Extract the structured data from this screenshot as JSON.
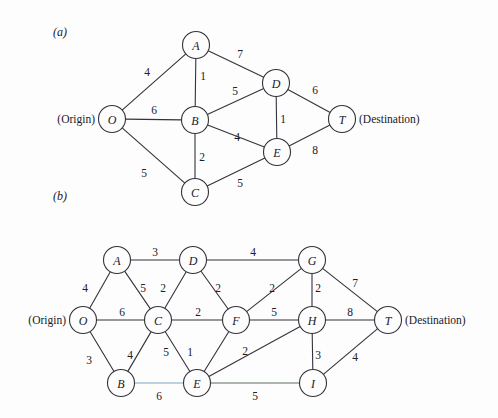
{
  "figure": {
    "background": "#fdfdfd",
    "line_color": "#33333a",
    "width": 498,
    "height": 418
  },
  "panels": [
    {
      "id": "panel-a",
      "label": "(a)",
      "label_pos": {
        "x": 53,
        "y": 32
      },
      "origin_caption": "(Origin)",
      "origin_caption_pos": {
        "x": 95,
        "y": 119
      },
      "destination_caption": "(Destination)",
      "destination_caption_pos": {
        "x": 359,
        "y": 119
      },
      "node_radius": 13.5,
      "nodes": [
        {
          "id": "O",
          "label": "O",
          "x": 112,
          "y": 119
        },
        {
          "id": "A",
          "label": "A",
          "x": 196,
          "y": 45
        },
        {
          "id": "B",
          "label": "B",
          "x": 195,
          "y": 120
        },
        {
          "id": "C",
          "label": "C",
          "x": 195,
          "y": 192
        },
        {
          "id": "D",
          "label": "D",
          "x": 276,
          "y": 83
        },
        {
          "id": "E",
          "label": "E",
          "x": 277,
          "y": 152
        },
        {
          "id": "T",
          "label": "T",
          "x": 342,
          "y": 119
        }
      ],
      "edges": [
        {
          "from": "O",
          "to": "A",
          "weight": "4",
          "label_x": 147,
          "label_y": 72,
          "tint": "none"
        },
        {
          "from": "O",
          "to": "B",
          "weight": "6",
          "label_x": 154,
          "label_y": 110,
          "tint": "none"
        },
        {
          "from": "O",
          "to": "C",
          "weight": "5",
          "label_x": 144,
          "label_y": 173,
          "tint": "none"
        },
        {
          "from": "A",
          "to": "B",
          "weight": "1",
          "label_x": 203,
          "label_y": 76,
          "tint": "none"
        },
        {
          "from": "A",
          "to": "D",
          "weight": "7",
          "label_x": 240,
          "label_y": 54,
          "tint": "none"
        },
        {
          "from": "B",
          "to": "C",
          "weight": "2",
          "label_x": 202,
          "label_y": 157,
          "tint": "none"
        },
        {
          "from": "B",
          "to": "D",
          "weight": "5",
          "label_x": 235,
          "label_y": 91,
          "tint": "none"
        },
        {
          "from": "B",
          "to": "E",
          "weight": "4",
          "label_x": 237,
          "label_y": 137,
          "tint": "none"
        },
        {
          "from": "C",
          "to": "E",
          "weight": "5",
          "label_x": 240,
          "label_y": 183,
          "tint": "none"
        },
        {
          "from": "D",
          "to": "E",
          "weight": "1",
          "label_x": 283,
          "label_y": 119,
          "tint": "none"
        },
        {
          "from": "D",
          "to": "T",
          "weight": "6",
          "label_x": 315,
          "label_y": 90,
          "tint": "none"
        },
        {
          "from": "E",
          "to": "T",
          "weight": "8",
          "label_x": 315,
          "label_y": 150,
          "tint": "none"
        }
      ]
    },
    {
      "id": "panel-b",
      "label": "(b)",
      "label_pos": {
        "x": 53,
        "y": 196
      },
      "origin_caption": "(Origin)",
      "origin_caption_pos": {
        "x": 66,
        "y": 320
      },
      "destination_caption": "(Destination)",
      "destination_caption_pos": {
        "x": 405,
        "y": 320
      },
      "node_radius": 13.5,
      "nodes": [
        {
          "id": "O",
          "label": "O",
          "x": 83,
          "y": 320
        },
        {
          "id": "A",
          "label": "A",
          "x": 117,
          "y": 260
        },
        {
          "id": "B",
          "label": "B",
          "x": 121,
          "y": 383
        },
        {
          "id": "C",
          "label": "C",
          "x": 158,
          "y": 320
        },
        {
          "id": "D",
          "label": "D",
          "x": 193,
          "y": 260
        },
        {
          "id": "E",
          "label": "E",
          "x": 197,
          "y": 383
        },
        {
          "id": "F",
          "label": "F",
          "x": 236,
          "y": 320
        },
        {
          "id": "G",
          "label": "G",
          "x": 312,
          "y": 260
        },
        {
          "id": "H",
          "label": "H",
          "x": 312,
          "y": 320
        },
        {
          "id": "I",
          "label": "I",
          "x": 313,
          "y": 383
        },
        {
          "id": "T",
          "label": "T",
          "x": 388,
          "y": 320
        }
      ],
      "edges": [
        {
          "from": "O",
          "to": "A",
          "weight": "4",
          "label_x": 85,
          "label_y": 288,
          "tint": "none"
        },
        {
          "from": "O",
          "to": "C",
          "weight": "6",
          "label_x": 122,
          "label_y": 312,
          "tint": "none"
        },
        {
          "from": "O",
          "to": "B",
          "weight": "3",
          "label_x": 89,
          "label_y": 360,
          "tint": "none"
        },
        {
          "from": "A",
          "to": "D",
          "weight": "3",
          "label_x": 155,
          "label_y": 252,
          "tint": "none"
        },
        {
          "from": "A",
          "to": "C",
          "weight": "5",
          "label_x": 143,
          "label_y": 288,
          "tint": "none"
        },
        {
          "from": "C",
          "to": "D",
          "weight": "2",
          "label_x": 163,
          "label_y": 288,
          "tint": "none"
        },
        {
          "from": "C",
          "to": "B",
          "weight": "4",
          "label_x": 130,
          "label_y": 355,
          "tint": "none"
        },
        {
          "from": "C",
          "to": "F",
          "weight": "2",
          "label_x": 198,
          "label_y": 312,
          "tint": "none"
        },
        {
          "from": "C",
          "to": "E",
          "weight": "5",
          "label_x": 166,
          "label_y": 352,
          "tint": "none"
        },
        {
          "from": "D",
          "to": "G",
          "weight": "4",
          "label_x": 253,
          "label_y": 252,
          "tint": "none"
        },
        {
          "from": "D",
          "to": "F",
          "weight": "2",
          "label_x": 218,
          "label_y": 288,
          "tint": "none"
        },
        {
          "from": "F",
          "to": "G",
          "weight": "2",
          "label_x": 272,
          "label_y": 288,
          "tint": "none"
        },
        {
          "from": "F",
          "to": "E",
          "weight": "1",
          "label_x": 190,
          "label_y": 352,
          "tint": "none"
        },
        {
          "from": "F",
          "to": "H",
          "weight": "5",
          "label_x": 274,
          "label_y": 312,
          "tint": "none"
        },
        {
          "from": "G",
          "to": "H",
          "weight": "2",
          "label_x": 318,
          "label_y": 288,
          "tint": "none"
        },
        {
          "from": "G",
          "to": "T",
          "weight": "7",
          "label_x": 355,
          "label_y": 283,
          "tint": "none"
        },
        {
          "from": "H",
          "to": "T",
          "weight": "8",
          "label_x": 350,
          "label_y": 312,
          "tint": "none"
        },
        {
          "from": "H",
          "to": "E",
          "weight": "2",
          "label_x": 245,
          "label_y": 351,
          "tint": "none"
        },
        {
          "from": "H",
          "to": "I",
          "weight": "3",
          "label_x": 318,
          "label_y": 355,
          "tint": "none"
        },
        {
          "from": "I",
          "to": "T",
          "weight": "4",
          "label_x": 355,
          "label_y": 357,
          "tint": "none"
        },
        {
          "from": "B",
          "to": "E",
          "weight": "6",
          "label_x": 159,
          "label_y": 396,
          "tint": "b"
        },
        {
          "from": "E",
          "to": "I",
          "weight": "5",
          "label_x": 255,
          "label_y": 396,
          "tint": "c"
        }
      ]
    }
  ]
}
